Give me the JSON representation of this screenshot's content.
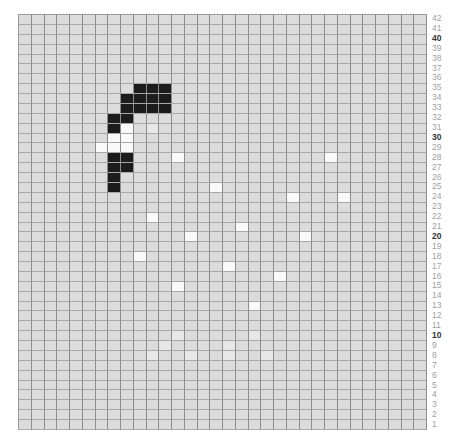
{
  "pattern": {
    "columns": 32,
    "rows": 42,
    "colors": {
      "background": "#dcdcdc",
      "grid_line": "#8c8c8c",
      "dark": "#1c1c1c",
      "white": "#fafafa",
      "faint": "#e8e8e8",
      "label": "#a0a0a0",
      "label_major": "#333333"
    },
    "row_labels": [
      42,
      41,
      40,
      39,
      38,
      37,
      36,
      35,
      34,
      33,
      32,
      31,
      30,
      29,
      28,
      27,
      26,
      25,
      24,
      23,
      22,
      21,
      20,
      19,
      18,
      17,
      16,
      15,
      14,
      13,
      12,
      11,
      10,
      9,
      8,
      7,
      6,
      5,
      4,
      3,
      2,
      1
    ],
    "major_labels": [
      40,
      30,
      20,
      10
    ],
    "dark_cells": [
      {
        "row": 35,
        "cols": [
          9,
          10,
          11
        ]
      },
      {
        "row": 34,
        "cols": [
          8,
          9,
          10,
          11
        ]
      },
      {
        "row": 33,
        "cols": [
          8,
          9,
          10,
          11
        ]
      },
      {
        "row": 32,
        "cols": [
          7,
          8
        ]
      },
      {
        "row": 31,
        "cols": [
          7
        ]
      },
      {
        "row": 28,
        "cols": [
          7,
          8
        ]
      },
      {
        "row": 27,
        "cols": [
          7,
          8
        ]
      },
      {
        "row": 26,
        "cols": [
          7
        ]
      },
      {
        "row": 25,
        "cols": [
          7
        ]
      }
    ],
    "white_cells": [
      {
        "row": 31,
        "cols": [
          8
        ]
      },
      {
        "row": 30,
        "cols": [
          7,
          8
        ]
      },
      {
        "row": 29,
        "cols": [
          6,
          7,
          8
        ]
      },
      {
        "row": 28,
        "cols": [
          12,
          24
        ]
      },
      {
        "row": 25,
        "cols": [
          15
        ]
      },
      {
        "row": 24,
        "cols": [
          21,
          25
        ]
      },
      {
        "row": 22,
        "cols": [
          10
        ]
      },
      {
        "row": 21,
        "cols": [
          17
        ]
      },
      {
        "row": 20,
        "cols": [
          13,
          22
        ]
      },
      {
        "row": 18,
        "cols": [
          9
        ]
      },
      {
        "row": 17,
        "cols": [
          16
        ]
      },
      {
        "row": 16,
        "cols": [
          20
        ]
      },
      {
        "row": 15,
        "cols": [
          12
        ]
      },
      {
        "row": 13,
        "cols": [
          18
        ]
      }
    ],
    "faint_cells": [
      {
        "row": 31,
        "cols": [
          10
        ]
      },
      {
        "row": 10,
        "cols": [
          12,
          18
        ]
      },
      {
        "row": 9,
        "cols": [
          11,
          16
        ]
      },
      {
        "row": 8,
        "cols": [
          10,
          13,
          16,
          19
        ]
      }
    ]
  }
}
